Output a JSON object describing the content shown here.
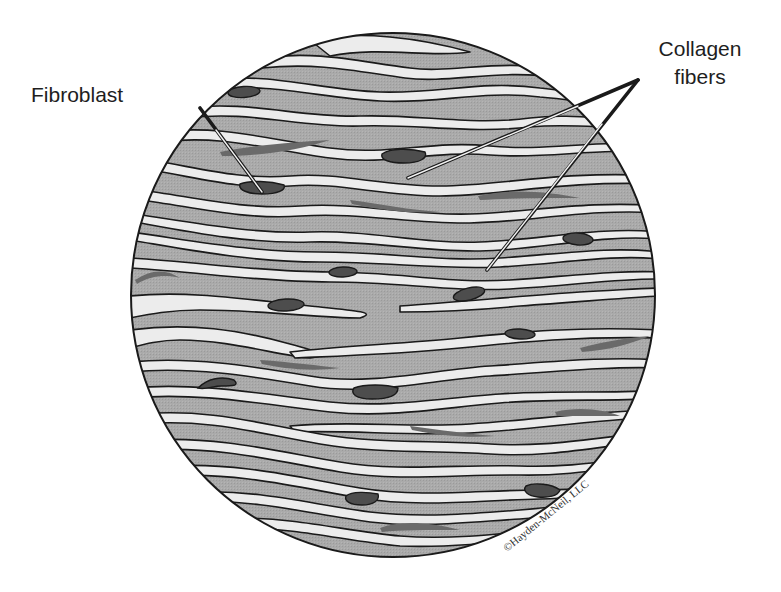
{
  "diagram": {
    "labels": {
      "fibroblast": "Fibroblast",
      "collagen_line1": "Collagen",
      "collagen_line2": "fibers"
    },
    "copyright": "©Hayden-McNeil, LLC",
    "colors": {
      "matrix_gray": "#a9a9a9",
      "fiber_white": "#ececec",
      "fiber_outline": "#1a1a1a",
      "nucleus_dark": "#4a4a4a",
      "elongated_nucleus": "#6a6a6a",
      "leader_line": "#1a1a1a"
    },
    "circle": {
      "cx": 393,
      "cy": 295,
      "r": 262
    },
    "leaders": {
      "fibroblast": {
        "from": [
          200,
          108
        ],
        "to": [
          262,
          192
        ]
      },
      "collagen_a": {
        "from": [
          638,
          80
        ],
        "to": [
          408,
          178
        ]
      },
      "collagen_b": {
        "from": [
          638,
          80
        ],
        "to": [
          487,
          270
        ]
      }
    }
  }
}
